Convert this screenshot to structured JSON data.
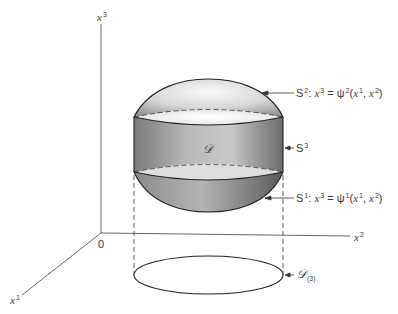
{
  "axes": {
    "x3": {
      "base": "x",
      "sup": "3"
    },
    "x2": {
      "base": "x",
      "sup": "2"
    },
    "x1": {
      "base": "x",
      "sup": "1"
    },
    "origin": "0"
  },
  "region": {
    "label": "𝒟"
  },
  "surfaces": {
    "s2": {
      "name": "S",
      "sup": "2",
      "sep": ": ",
      "lhs_base": "x",
      "lhs_sup": "3",
      "eq": " = ",
      "fn": "ψ",
      "fn_sup": "2",
      "args_open": "(",
      "arg1_base": "x",
      "arg1_sup": "1",
      "comma": ", ",
      "arg2_base": "x",
      "arg2_sup": "2",
      "args_close": ")"
    },
    "s3": {
      "name": "S",
      "sup": "3"
    },
    "s1": {
      "name": "S",
      "sup": "1",
      "sep": ": ",
      "lhs_base": "x",
      "lhs_sup": "3",
      "eq": " = ",
      "fn": "ψ",
      "fn_sup": "1",
      "args_open": "(",
      "arg1_base": "x",
      "arg1_sup": "1",
      "comma": ", ",
      "arg2_base": "x",
      "arg2_sup": "2",
      "args_close": ")"
    }
  },
  "projection": {
    "label": "𝒟",
    "sub": "(3)"
  },
  "colors": {
    "line": "#2a2a2a",
    "axis": "#555555",
    "shade_dark": "#6e6e6e",
    "shade_light": "#f2f2f2"
  }
}
